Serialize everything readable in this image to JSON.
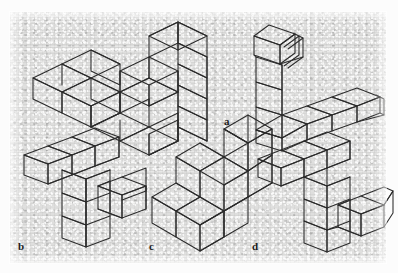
{
  "figure": {
    "background_color": "#dededd",
    "line_color": "#2b2b2b",
    "panel": {
      "x": 10,
      "y": 12,
      "width": 376,
      "height": 251
    },
    "labels": [
      {
        "id": "a",
        "text": "a",
        "x": 224,
        "y": 116
      },
      {
        "id": "b",
        "text": "b",
        "x": 18,
        "y": 241
      },
      {
        "id": "c",
        "text": "c",
        "x": 149,
        "y": 241
      },
      {
        "id": "d",
        "text": "d",
        "x": 252,
        "y": 241
      }
    ],
    "objects": [
      {
        "id": "standard",
        "name": "standard-figure",
        "label": "",
        "position": "top-left",
        "cube_count": 10,
        "shape": "L-shaped slab with upright wall"
      },
      {
        "id": "a",
        "name": "figure-a",
        "label": "a",
        "position": "top-right",
        "cube_count": 7,
        "shape": "L-shaped chain, vertical arm of 3 with forward cube, horizontal arm of 4"
      },
      {
        "id": "b",
        "name": "figure-b",
        "label": "b",
        "position": "bottom-left",
        "cube_count": 8,
        "shape": "T/cross shaped chain, horizontal bar of 3 with descending arm of 3 and side arm of 2"
      },
      {
        "id": "c",
        "name": "figure-c",
        "label": "c",
        "position": "bottom-center",
        "cube_count": 10,
        "shape": "Stepped staircase block, three rising tiers"
      },
      {
        "id": "d",
        "name": "figure-d",
        "label": "d",
        "position": "bottom-right",
        "cube_count": 9,
        "shape": "Zig-zag chain, horizontal bar of 3, vertical arm of 3, horizontal arm of 3"
      }
    ]
  }
}
